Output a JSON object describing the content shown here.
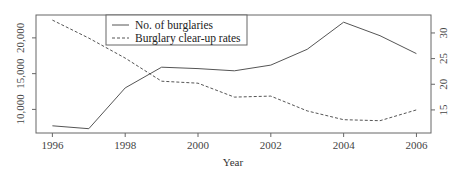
{
  "chart_data": {
    "type": "line",
    "title": "",
    "xlabel": "Year",
    "ylabel": "",
    "ylabel_right": "",
    "x": [
      1996,
      1997,
      1998,
      1999,
      2000,
      2001,
      2002,
      2003,
      2004,
      2005,
      2006
    ],
    "x_ticks": [
      1996,
      1998,
      2000,
      2002,
      2004,
      2006
    ],
    "x_tick_labels": [
      "1996",
      "1998",
      "2000",
      "2002",
      "2004",
      "2006"
    ],
    "xlim": [
      1995.55,
      2006.4
    ],
    "y_left_ticks": [
      10000,
      15000,
      20000
    ],
    "y_left_tick_labels": [
      "10,000",
      "15,000",
      "20,000"
    ],
    "ylim_left": [
      6700,
      23200
    ],
    "y_right_ticks": [
      15,
      20,
      25,
      30
    ],
    "y_right_tick_labels": [
      "15",
      "20",
      "25",
      "30"
    ],
    "ylim_right": [
      10.5,
      33.5
    ],
    "grid": false,
    "legend_position": "top-left-center",
    "series": [
      {
        "name": "No. of burglaries",
        "axis": "left",
        "line_style": "solid",
        "color": "#555555",
        "values": [
          7700,
          7300,
          13000,
          15900,
          15700,
          15400,
          16200,
          18400,
          22200,
          20300,
          17800
        ]
      },
      {
        "name": "Burglary clear-up rates",
        "axis": "right",
        "line_style": "dashed",
        "color": "#555555",
        "values": [
          32.5,
          29.0,
          25.1,
          20.6,
          20.2,
          17.5,
          17.7,
          14.8,
          13.1,
          12.9,
          15.0
        ]
      }
    ]
  },
  "legend": {
    "items": [
      {
        "label": "No. of burglaries",
        "style": "solid"
      },
      {
        "label": "Burglary clear-up rates",
        "style": "dashed"
      }
    ]
  },
  "colors": {
    "axis": "#555555",
    "line": "#555555",
    "text": "#333333"
  }
}
